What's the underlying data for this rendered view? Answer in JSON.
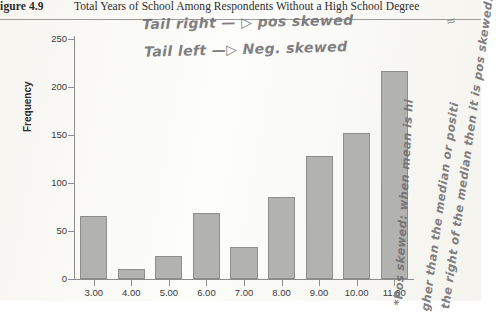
{
  "caption": {
    "figure_label": "Figure 4.9",
    "title": "Total Years of School Among Respondents Without a High School Degree"
  },
  "annotations": {
    "line1": "Tail right — ▷ pos skewed",
    "line2": "Tail left —▷ Neg. skewed",
    "vertical_1": "*Pos skewed: when mean is hi",
    "vertical_2": "gher than the median or positi",
    "vertical_3": "the right of the median then it is pos skewed.",
    "stray_mark": "≈"
  },
  "chart_data": {
    "type": "bar",
    "title": "Total Years of School Among Respondents Without a High School Degree",
    "xlabel": "",
    "ylabel": "Frequency",
    "categories": [
      "3.00",
      "4.00",
      "5.00",
      "6.00",
      "7.00",
      "8.00",
      "9.00",
      "10.00",
      "11.00"
    ],
    "values": [
      66,
      10,
      24,
      69,
      33,
      85,
      128,
      152,
      217
    ],
    "ylim": [
      0,
      250
    ],
    "yticks": [
      0,
      50,
      100,
      150,
      200,
      250
    ],
    "ytick_labels": [
      "0",
      "50",
      "100",
      "150",
      "200",
      "250"
    ],
    "grid": false,
    "legend": "none",
    "bar_fill": "#b2b2b0",
    "bar_border": "#8e8e8c"
  }
}
